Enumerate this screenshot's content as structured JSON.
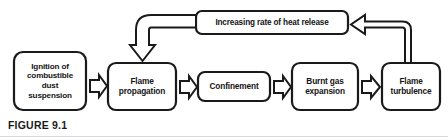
{
  "figure": {
    "caption": "FIGURE 9.1",
    "type": "process-flow-diagram",
    "background_color": "#ffffff",
    "stroke_color": "#1a1a1a",
    "text_color": "#141414",
    "rule_color": "#d8d9dc"
  },
  "nodes": [
    {
      "id": "ignition",
      "label": "Ignition of\ncombustible\ndust\nsuspension",
      "shape": "rounded-rect",
      "x": 14,
      "y": 52,
      "w": 72,
      "h": 58
    },
    {
      "id": "flame-propagation",
      "label": "Flame\npropagation",
      "shape": "rounded-rect",
      "x": 108,
      "y": 63,
      "w": 68,
      "h": 47
    },
    {
      "id": "confinement",
      "label": "Confinement",
      "shape": "rounded-rect",
      "x": 198,
      "y": 72,
      "w": 72,
      "h": 29
    },
    {
      "id": "burnt-gas-expansion",
      "label": "Burnt gas\nexpansion",
      "shape": "rounded-rect",
      "x": 292,
      "y": 63,
      "w": 66,
      "h": 47
    },
    {
      "id": "flame-turbulence",
      "label": "Flame\nturbulence",
      "shape": "rounded-rect",
      "x": 382,
      "y": 63,
      "w": 58,
      "h": 47
    },
    {
      "id": "heat-release",
      "label": "Increasing rate of heat release",
      "shape": "rounded-rect",
      "x": 196,
      "y": 11,
      "w": 152,
      "h": 23
    }
  ],
  "connectors": [
    {
      "id": "ignition-to-flame-propagation",
      "style": "block-arrow",
      "direction": "right",
      "from": "ignition",
      "to": "flame-propagation"
    },
    {
      "id": "flame-propagation-to-confinement",
      "style": "block-arrow",
      "direction": "right",
      "from": "flame-propagation",
      "to": "confinement"
    },
    {
      "id": "confinement-to-burnt-gas-expansion",
      "style": "block-arrow",
      "direction": "right",
      "from": "confinement",
      "to": "burnt-gas-expansion"
    },
    {
      "id": "burnt-gas-expansion-to-flame-turbulence",
      "style": "block-arrow",
      "direction": "right",
      "from": "burnt-gas-expansion",
      "to": "flame-turbulence"
    },
    {
      "id": "flame-turbulence-to-heat-release",
      "style": "outline-elbow-arrow",
      "direction": "up-left",
      "from": "flame-turbulence",
      "to": "heat-release"
    },
    {
      "id": "heat-release-to-flame-propagation",
      "style": "outline-elbow-arrow",
      "direction": "left-down",
      "from": "heat-release",
      "to": "flame-propagation"
    }
  ]
}
